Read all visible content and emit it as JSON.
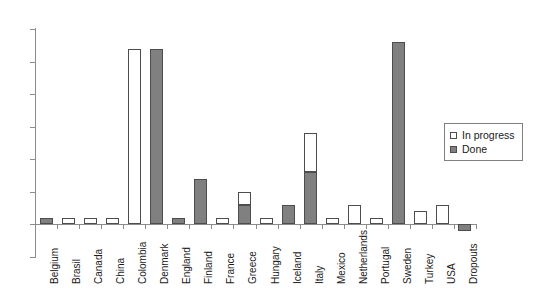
{
  "chart_data": {
    "type": "bar",
    "title": "",
    "subtitle": "",
    "xlabel": "",
    "ylabel": "",
    "ylim": [
      -5,
      30
    ],
    "yticks": [
      -5,
      0,
      5,
      10,
      15,
      20,
      25,
      30
    ],
    "ytick_labels": [
      "-5",
      "0",
      "5",
      "10",
      "15",
      "20",
      "25",
      "30"
    ],
    "grid": false,
    "stacked": true,
    "legend_position": "right",
    "categories": [
      "Belgium",
      "Brasil",
      "Canada",
      "China",
      "Colombia",
      "Denmark",
      "England",
      "Finland",
      "France",
      "Greece",
      "Hungary",
      "Iceland",
      "Italy",
      "Mexico",
      "Netherlands",
      "Portugal",
      "Sweden",
      "Turkey",
      "USA",
      "Dropouts"
    ],
    "series": [
      {
        "name": "Done",
        "color": "#808080",
        "values": [
          1,
          0,
          0,
          0,
          0,
          27,
          1,
          7,
          0,
          3,
          0,
          3,
          8,
          0,
          0,
          0,
          28,
          0,
          0,
          -1
        ]
      },
      {
        "name": "In progress",
        "color": "#ffffff",
        "values": [
          0,
          1,
          1,
          1,
          27,
          0,
          0,
          0,
          1,
          2,
          1,
          0,
          6,
          1,
          3,
          1,
          0,
          2,
          3,
          0
        ]
      }
    ],
    "totals": [
      1,
      1,
      1,
      1,
      27,
      27,
      1,
      7,
      1,
      5,
      1,
      3,
      14,
      1,
      3,
      1,
      28,
      2,
      3,
      -1
    ]
  },
  "legend": {
    "items": [
      {
        "label": "In progress",
        "swatch": "prog"
      },
      {
        "label": "Done",
        "swatch": "done"
      }
    ]
  }
}
